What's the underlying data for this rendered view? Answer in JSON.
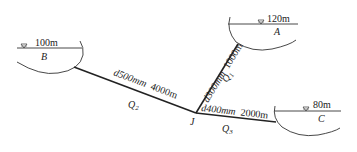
{
  "diagram": {
    "type": "three-reservoir pipe network",
    "reservoirs": [
      {
        "id": "B",
        "label": "B",
        "elevation": "100m"
      },
      {
        "id": "A",
        "label": "A",
        "elevation": "120m"
      },
      {
        "id": "C",
        "label": "C",
        "elevation": "80m"
      }
    ],
    "junction": {
      "label": "J"
    },
    "pipes": [
      {
        "from": "B",
        "to": "J",
        "diameter": "d500mm",
        "length": "4000m",
        "flow": "Q",
        "flow_sub": "2"
      },
      {
        "from": "A",
        "to": "J",
        "diameter": "d300mm",
        "length": "1000m",
        "flow": "Q",
        "flow_sub": "1"
      },
      {
        "from": "J",
        "to": "C",
        "diameter": "d400mm",
        "length": "2000m",
        "flow": "Q",
        "flow_sub": "3"
      }
    ],
    "colors": {
      "line": "#222222",
      "background": "#ffffff"
    }
  }
}
